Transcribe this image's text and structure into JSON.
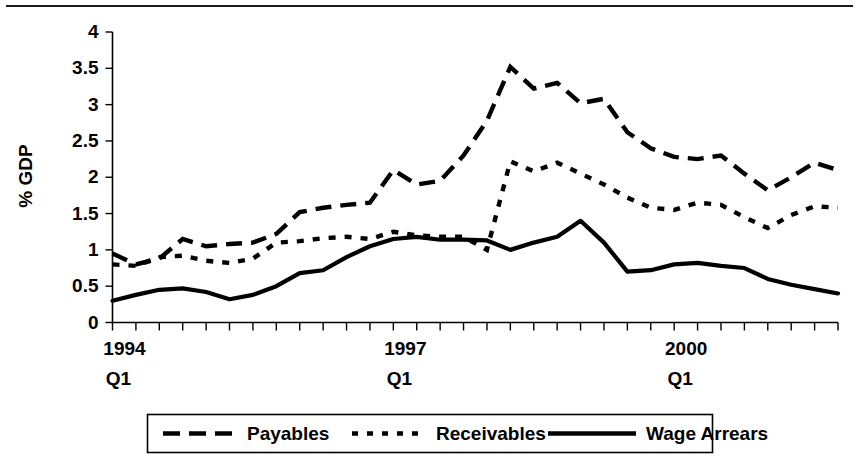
{
  "chart_data": {
    "type": "line",
    "title": "",
    "xlabel": "",
    "ylabel": "% GDP",
    "ylim": [
      0,
      4
    ],
    "ytick_values": [
      0,
      0.5,
      1,
      1.5,
      2,
      2.5,
      3,
      3.5,
      4
    ],
    "ytick_labels": [
      "0",
      "0.5",
      "1",
      "1.5",
      "2",
      "2.5",
      "3",
      "3.5",
      "4"
    ],
    "grid": false,
    "legend_position": "bottom",
    "x_tick_count": 32,
    "x": [
      "1994 Q1",
      "1994 Q2",
      "1994 Q3",
      "1994 Q4",
      "1995 Q1",
      "1995 Q2",
      "1995 Q3",
      "1995 Q4",
      "1996 Q1",
      "1996 Q2",
      "1996 Q3",
      "1996 Q4",
      "1997 Q1",
      "1997 Q2",
      "1997 Q3",
      "1997 Q4",
      "1998 Q1",
      "1998 Q2",
      "1998 Q3",
      "1998 Q4",
      "1999 Q1",
      "1999 Q2",
      "1999 Q3",
      "1999 Q4",
      "2000 Q1",
      "2000 Q2",
      "2000 Q3",
      "2000 Q4",
      "2001 Q1",
      "2001 Q2",
      "2001 Q3",
      "2001 Q4"
    ],
    "xtick_labels": [
      {
        "index": 0,
        "year": "1994",
        "quarter": "Q1"
      },
      {
        "index": 12,
        "year": "1997",
        "quarter": "Q1"
      },
      {
        "index": 24,
        "year": "2000",
        "quarter": "Q1"
      }
    ],
    "series": [
      {
        "name": "Payables",
        "style": "long-dash",
        "values": [
          0.95,
          0.8,
          0.88,
          1.15,
          1.05,
          1.08,
          1.1,
          1.22,
          1.52,
          1.58,
          1.62,
          1.65,
          2.1,
          1.9,
          1.95,
          2.3,
          2.78,
          3.52,
          3.22,
          3.3,
          3.02,
          3.08,
          2.62,
          2.4,
          2.28,
          2.25,
          2.3,
          2.05,
          1.82,
          2.0,
          2.2,
          2.1
        ]
      },
      {
        "name": "Receivables",
        "style": "dotted",
        "values": [
          0.8,
          0.78,
          0.9,
          0.92,
          0.85,
          0.82,
          0.88,
          1.1,
          1.12,
          1.16,
          1.18,
          1.15,
          1.25,
          1.2,
          1.18,
          1.18,
          1.0,
          2.22,
          2.08,
          2.2,
          2.05,
          1.9,
          1.72,
          1.58,
          1.55,
          1.65,
          1.62,
          1.45,
          1.3,
          1.48,
          1.6,
          1.58
        ]
      },
      {
        "name": "Wage Arrears",
        "style": "solid",
        "values": [
          0.3,
          0.38,
          0.45,
          0.47,
          0.42,
          0.32,
          0.38,
          0.5,
          0.68,
          0.72,
          0.9,
          1.05,
          1.15,
          1.18,
          1.14,
          1.14,
          1.13,
          1.0,
          1.1,
          1.18,
          1.4,
          1.1,
          0.7,
          0.72,
          0.8,
          0.82,
          0.78,
          0.75,
          0.6,
          0.52,
          0.46,
          0.4
        ]
      }
    ]
  },
  "legend": {
    "items": [
      {
        "label": "Payables",
        "style": "long-dash"
      },
      {
        "label": "Receivables",
        "style": "dotted"
      },
      {
        "label": "Wage Arrears",
        "style": "solid"
      }
    ]
  },
  "axis": {
    "y_title": "% GDP"
  }
}
